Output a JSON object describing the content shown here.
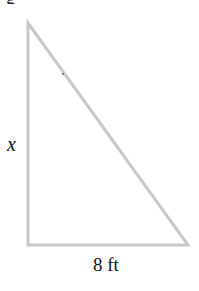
{
  "diagram": {
    "type": "right-triangle",
    "clipped_top_text": "g",
    "vertices": {
      "apex": [
        28,
        23
      ],
      "right_angle": [
        28,
        245
      ],
      "base_end": [
        188,
        245
      ]
    },
    "stroke_color": "#c8c8c8",
    "labels": {
      "vertical_side": "x",
      "base": "8 ft"
    }
  }
}
